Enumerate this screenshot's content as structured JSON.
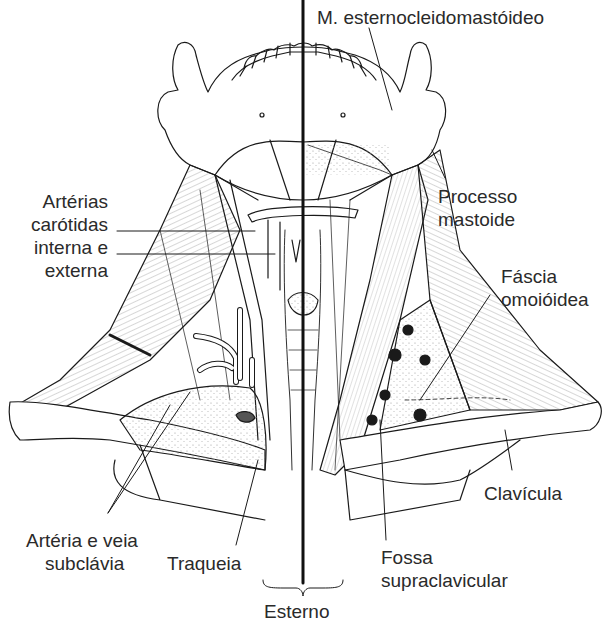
{
  "figure": {
    "midline": "linha média (esterno)",
    "colors": {
      "ink": "#1a1a1a",
      "text": "#2a2a2a",
      "background": "#ffffff",
      "shading": "#bdbdbd"
    }
  },
  "labels": {
    "scm": "M. esternocleidomastóideo",
    "carotid_1": "Artérias",
    "carotid_2": "carótidas",
    "carotid_3": "interna e",
    "carotid_4": "externa",
    "mastoid_1": "Processo",
    "mastoid_2": "mastoide",
    "fascia_1": "Fáscia",
    "fascia_2": "omoióidea",
    "clavicle": "Clavícula",
    "subclavian_1": "Artéria e veia",
    "subclavian_2": "subclávia",
    "trachea": "Traqueia",
    "fossa_1": "Fossa",
    "fossa_2": "supraclavicular",
    "sternum": "Esterno"
  }
}
